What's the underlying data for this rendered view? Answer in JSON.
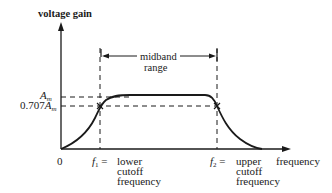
{
  "diagram": {
    "y_axis_label": "voltage gain",
    "x_axis_label": "frequency",
    "origin_label": "0",
    "midband_label_line1": "midband",
    "midband_label_line2": "range",
    "am_label": "A",
    "am_sub": "m",
    "am707_prefix": "0.707",
    "am707_label": "A",
    "am707_sub": "m",
    "f1_symbol": "f",
    "f1_sub": "1",
    "f1_eq": "=",
    "f1_desc_line1": "lower",
    "f1_desc_line2": "cutoff",
    "f1_desc_line3": "frequency",
    "f2_symbol": "f",
    "f2_sub": "2",
    "f2_eq": "=",
    "f2_desc_line1": "upper",
    "f2_desc_line2": "cutoff",
    "f2_desc_line3": "frequency",
    "colors": {
      "ink": "#1a1a1a",
      "background": "#ffffff"
    }
  }
}
